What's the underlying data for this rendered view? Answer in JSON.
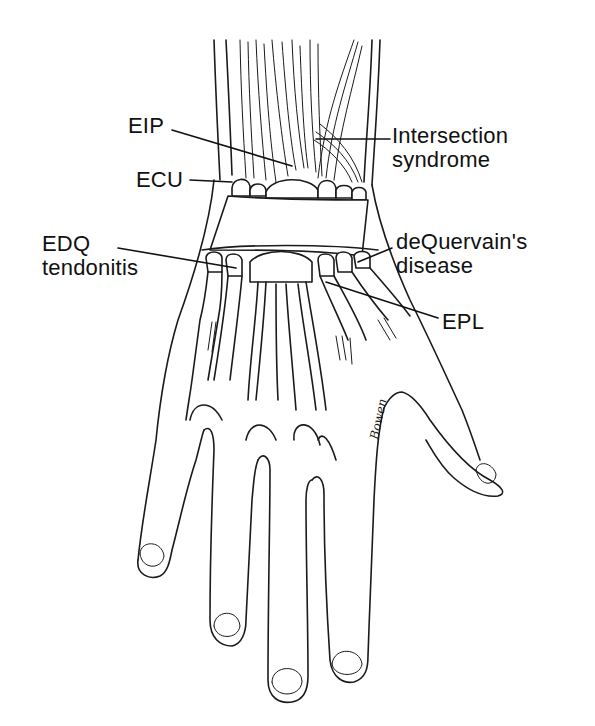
{
  "figure": {
    "ink_color": "#1a1a1a",
    "background": "#ffffff",
    "labels": {
      "eip": {
        "lines": [
          "EIP"
        ]
      },
      "ecu": {
        "lines": [
          "ECU"
        ]
      },
      "intersection": {
        "lines": [
          "Intersection",
          "syndrome"
        ]
      },
      "edq": {
        "lines": [
          "EDQ",
          "tendonitis"
        ]
      },
      "dequervain": {
        "lines": [
          "deQuervain's",
          "disease"
        ]
      },
      "epl": {
        "lines": [
          "EPL"
        ]
      }
    },
    "signature": "Bowen"
  }
}
